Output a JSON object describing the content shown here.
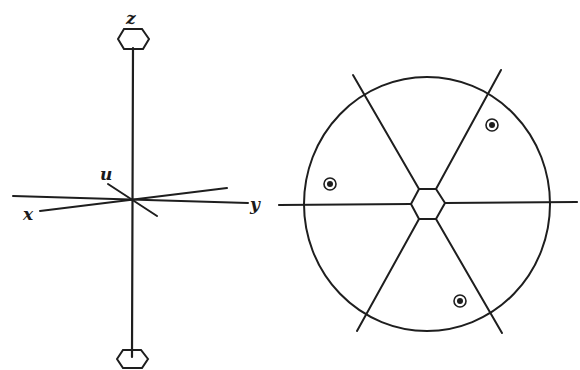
{
  "figure": {
    "colors": {
      "ink": "#1e1e1e",
      "paper": "#ffffff"
    },
    "left_panel": {
      "description": "Molecular axis frame with hexagonal rings on the vertical axis",
      "labels": {
        "z": "z",
        "u": "u",
        "x": "x",
        "y": "y"
      },
      "top_ring": "hexagon",
      "bottom_ring": "hexagon"
    },
    "right_panel": {
      "description": "Circular projection with central hexagon and six radial spokes",
      "center_ring": "hexagon",
      "spoke_count": 6,
      "markers": [
        {
          "name": "marker-upper-right",
          "type": "circled-dot"
        },
        {
          "name": "marker-left",
          "type": "circled-dot"
        },
        {
          "name": "marker-lower",
          "type": "circled-dot"
        }
      ]
    }
  }
}
